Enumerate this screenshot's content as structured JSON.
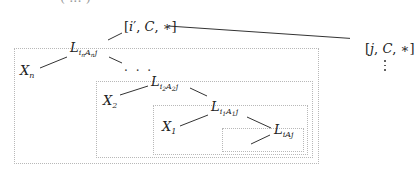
{
  "diagram": {
    "type": "tree",
    "top_clipped_text": "( ... )",
    "nodes": {
      "root_left": {
        "bracket_open": "[",
        "i": "i",
        "prime": "′",
        "sep1": ", ",
        "c": "C",
        "sep2": ", ",
        "star": "∗",
        "bracket_close": "]"
      },
      "root_right": {
        "bracket_open": "[",
        "j": "j",
        "sep1": ", ",
        "c": "C",
        "sep2": ", ",
        "star": "∗",
        "bracket_close": "]"
      },
      "Ln": {
        "L": "L",
        "i": "i",
        "i_sub": "n",
        "A": "A",
        "A_sub": "n",
        "j": "j"
      },
      "Xn": {
        "X": "X",
        "sub": "n"
      },
      "ellipsis": ". . .",
      "L2": {
        "L": "L",
        "i": "i",
        "i_sub": "2",
        "A": "A",
        "A_sub": "2",
        "j": "j"
      },
      "X2": {
        "X": "X",
        "sub": "2"
      },
      "L1": {
        "L": "L",
        "i": "i",
        "i_sub": "1",
        "A": "A",
        "A_sub": "1",
        "j": "j"
      },
      "X1": {
        "X": "X",
        "sub": "1"
      },
      "L0": {
        "L": "L",
        "i": "i",
        "A": "A",
        "j": "j"
      }
    },
    "colors": {
      "line": "#333333",
      "box_border": "#b8b8b8",
      "text": "#222222"
    }
  }
}
